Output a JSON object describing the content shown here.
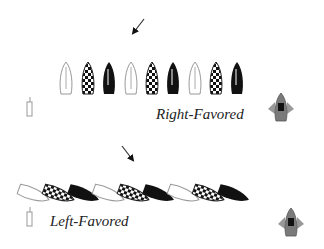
{
  "diagram": {
    "title": "",
    "panels": [
      {
        "name": "right-favored",
        "label": "Right-Favored",
        "wind_arrow": {
          "direction": "from upper-right",
          "x1": 144,
          "y1": 19,
          "x2": 133,
          "y2": 33
        },
        "boat_orientation": "upright",
        "boats": [
          "outline",
          "checkered",
          "black",
          "outline",
          "checkered",
          "black",
          "outline",
          "checkered",
          "black"
        ],
        "pin_mark": "left",
        "committee_boat": "right"
      },
      {
        "name": "left-favored",
        "label": "Left-Favored",
        "wind_arrow": {
          "direction": "from upper-left",
          "x1": 122,
          "y1": 146,
          "x2": 133,
          "y2": 160
        },
        "boat_orientation": "tilted",
        "boats": [
          "outline",
          "checkered",
          "black",
          "outline",
          "checkered",
          "black",
          "outline",
          "checkered",
          "black"
        ],
        "pin_mark": "left",
        "committee_boat": "right"
      }
    ],
    "colors": {
      "outline_boat": "#9a9a9a",
      "black_boat": "#111111",
      "committee_boat": "#7a7a7a",
      "committee_flags": "#9a9a9a"
    }
  }
}
